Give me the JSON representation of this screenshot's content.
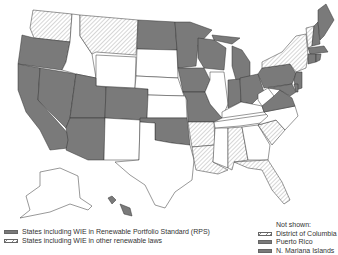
{
  "map": {
    "title": "States including WIE in renewable energy policies",
    "colors": {
      "rps": "#7a7a7a",
      "other_hatch": "#888888",
      "none": "#ffffff",
      "border": "#333333"
    },
    "states_rps": [
      "WA-coast? no",
      "OR",
      "CA",
      "NV",
      "UT",
      "AZ",
      "CO",
      "ND",
      "MN",
      "WI",
      "IA",
      "MO",
      "OK",
      "MI",
      "IN",
      "OH",
      "PA",
      "VA",
      "MD",
      "DE",
      "NJ",
      "CT",
      "RI",
      "MA",
      "NH",
      "ME",
      "HI"
    ],
    "states_other_laws": [
      "WA",
      "MT",
      "NY",
      "VT",
      "AR",
      "LA",
      "AL",
      "GA",
      "FL"
    ],
    "states_none": [
      "ID",
      "WY",
      "SD",
      "NE",
      "KS",
      "NM",
      "TX",
      "IL",
      "KY",
      "TN",
      "MS",
      "SC",
      "NC",
      "WV",
      "AK"
    ]
  },
  "legend": {
    "items": [
      {
        "label": "States including WIE in Renewable Portfolio Standard (RPS)",
        "type": "rps"
      },
      {
        "label": "States including WIE in other renewable laws",
        "type": "other"
      }
    ],
    "not_shown": {
      "heading": "Not shown:",
      "items": [
        {
          "label": "District of Columbia",
          "type": "other"
        },
        {
          "label": "Puerto Rico",
          "type": "rps"
        },
        {
          "label": "N. Mariana Islands",
          "type": "rps"
        }
      ]
    }
  }
}
